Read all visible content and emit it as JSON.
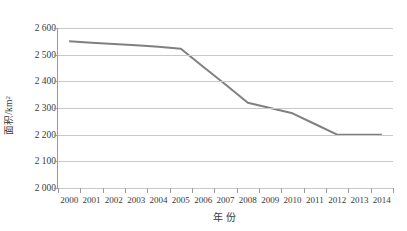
{
  "chart_data": {
    "type": "line",
    "title": "",
    "xlabel": "年份",
    "ylabel": "面积/km²",
    "ylabel_base": "面积/km",
    "ylabel_sup": "2",
    "categories": [
      "2000",
      "2001",
      "2002",
      "2003",
      "2004",
      "2005",
      "2006",
      "2007",
      "2008",
      "2009",
      "2010",
      "2011",
      "2012",
      "2013",
      "2014"
    ],
    "x": [
      2000,
      2001,
      2002,
      2003,
      2004,
      2005,
      2006,
      2007,
      2008,
      2009,
      2010,
      2011,
      2012,
      2013,
      2014
    ],
    "values": [
      2550,
      2545,
      2540,
      2535,
      2530,
      2522,
      2455,
      2388,
      2320,
      2300,
      2280,
      2240,
      2200,
      2200,
      2200
    ],
    "series": [
      {
        "name": "面积",
        "color": "#808080",
        "values": [
          2550,
          2545,
          2540,
          2535,
          2530,
          2522,
          2455,
          2388,
          2320,
          2300,
          2280,
          2240,
          2200,
          2200,
          2200
        ]
      }
    ],
    "ylim": [
      2000,
      2600
    ],
    "ytick_step": 100,
    "yticks": [
      2600,
      2500,
      2400,
      2300,
      2200,
      2100,
      2000
    ],
    "ytick_labels": [
      "2 600",
      "2 500",
      "2 400",
      "2 300",
      "2 200",
      "2 100",
      "2 000"
    ],
    "grid": true,
    "grid_axis": "y",
    "grid_color": "#c9c9c9",
    "legend": false,
    "legend_position": "none",
    "markers": false,
    "line_width": 2,
    "background": "#ffffff",
    "axis_color": "#9a9a9a",
    "text_color": "#3a3a3a"
  }
}
